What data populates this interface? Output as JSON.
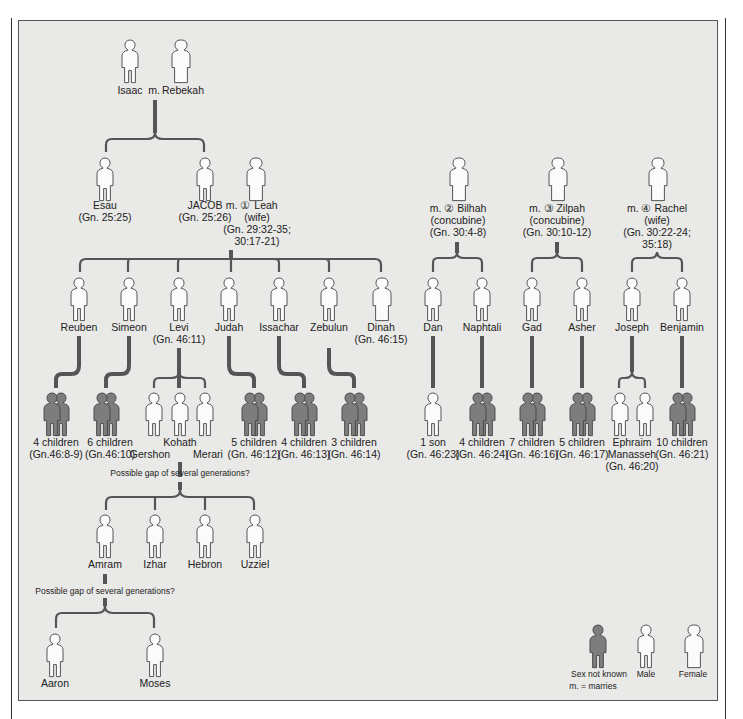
{
  "colors": {
    "background": "#e9e9e7",
    "line": "#555555",
    "unknown_fill": "#7d7d7d",
    "figure_fill": "#fbfbfb"
  },
  "gen1": {
    "isaac": "Isaac",
    "marries": "m.",
    "rebekah": "Rebekah"
  },
  "gen2": {
    "esau": {
      "name": "Esau",
      "ref": "(Gn. 25:25)"
    },
    "jacob": {
      "name": "JACOB",
      "marries": "m. ①",
      "ref": "(Gn. 25:26)"
    },
    "leah": {
      "name": "Leah",
      "role": "(wife)",
      "ref1": "(Gn. 29:32-35;",
      "ref2": "30:17-21)"
    },
    "bilhah": {
      "line1": "m. ② Bilhah",
      "role": "(concubine)",
      "ref": "(Gn. 30:4-8)"
    },
    "zilpah": {
      "line1": "m. ③ Zilpah",
      "role": "(concubine)",
      "ref": "(Gn. 30:10-12)"
    },
    "rachel": {
      "line1": "m. ④ Rachel",
      "role": "(wife)",
      "ref1": "(Gn. 30:22-24;",
      "ref2": "35:18)"
    }
  },
  "tribes": [
    {
      "name": "Reuben"
    },
    {
      "name": "Simeon"
    },
    {
      "name": "Levi",
      "ref": "(Gn. 46:11)"
    },
    {
      "name": "Judah"
    },
    {
      "name": "Issachar"
    },
    {
      "name": "Zebulun"
    },
    {
      "name": "Dinah",
      "ref": "(Gn. 46:15)"
    },
    {
      "name": "Dan"
    },
    {
      "name": "Naphtali"
    },
    {
      "name": "Gad"
    },
    {
      "name": "Asher"
    },
    {
      "name": "Joseph"
    },
    {
      "name": "Benjamin"
    }
  ],
  "children": [
    {
      "count": "4 children",
      "ref": "(Gn.46:8-9)"
    },
    {
      "count": "6 children",
      "ref": "(Gn.46:10)"
    },
    {
      "count": "5 children",
      "ref": "(Gn. 46:12)"
    },
    {
      "count": "4 children",
      "ref": "(Gn. 46:13)"
    },
    {
      "count": "3 children",
      "ref": "(Gn. 46:14)"
    },
    {
      "count": "1 son",
      "ref": "(Gn. 46:23)"
    },
    {
      "count": "4 children",
      "ref": "(Gn. 46:24)"
    },
    {
      "count": "7 children",
      "ref": "(Gn. 46:16)"
    },
    {
      "count": "5 children",
      "ref": "(Gn. 46:17)"
    },
    {
      "count": "10 children",
      "ref": "(Gn. 46:21)"
    }
  ],
  "levi_sons": {
    "gershon": "Gershon",
    "kohath": "Kohath",
    "merari": "Merari"
  },
  "joseph_sons": {
    "ephraim": "Ephraim",
    "manasseh": "Manasseh",
    "ref": "(Gn. 46:20)"
  },
  "gap_note": "Possible gap of several generations?",
  "kohath_sons": [
    "Amram",
    "Izhar",
    "Hebron",
    "Uzziel"
  ],
  "amram_sons": [
    "Aaron",
    "Moses"
  ],
  "legend": {
    "unknown": "Sex not known",
    "male": "Male",
    "female": "Female",
    "marries_note": "m. = marries"
  }
}
